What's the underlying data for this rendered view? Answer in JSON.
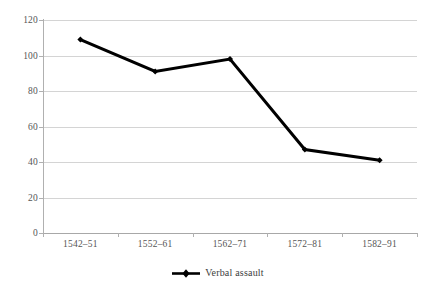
{
  "chart_data": {
    "type": "line",
    "title": "",
    "subtitle": "",
    "xlabel": "",
    "ylabel": "",
    "categories": [
      "1542–51",
      "1552–61",
      "1562–71",
      "1572–81",
      "1582–91"
    ],
    "series": [
      {
        "name": "Verbal assault",
        "values": [
          109,
          91,
          98,
          47,
          41
        ],
        "color": "#000000",
        "marker": "diamond",
        "line_width": 3
      }
    ],
    "ylim": [
      0,
      120
    ],
    "ytick_values": [
      0,
      20,
      40,
      60,
      80,
      100,
      120
    ],
    "ytick_labels": [
      "0",
      "20",
      "40",
      "60",
      "80",
      "100",
      "120"
    ],
    "grid": {
      "horizontal": true,
      "vertical": false,
      "color": "#d4d4d4"
    },
    "legend": {
      "position": "bottom",
      "entries": [
        "Verbal assault"
      ]
    },
    "axis_color": "#b0b0b0",
    "background": "#ffffff"
  }
}
